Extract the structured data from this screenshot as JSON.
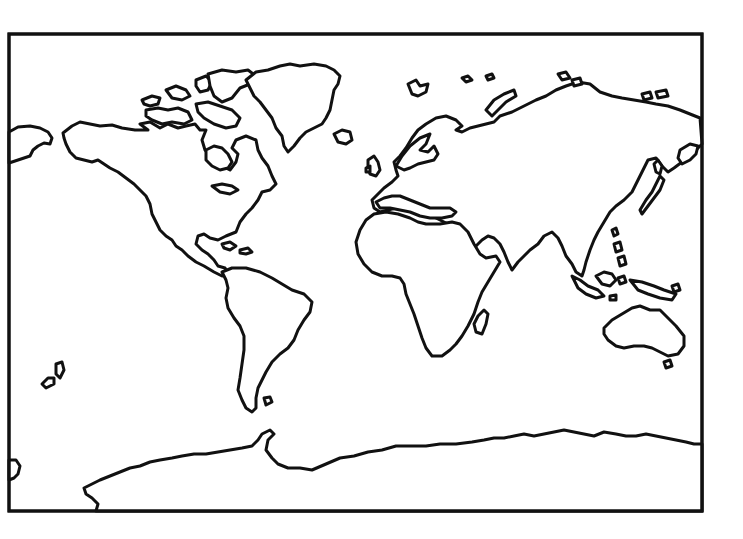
{
  "map": {
    "type": "blank-outline-world-map",
    "projection": "rectangular",
    "colors": {
      "background": "#ffffff",
      "outline": "#111111",
      "land_fill": "#ffffff"
    },
    "frame": {
      "x": 9,
      "y": 34,
      "width": 693,
      "height": 477
    },
    "regions": [
      {
        "id": "north-america",
        "name": "North America"
      },
      {
        "id": "greenland",
        "name": "Greenland"
      },
      {
        "id": "canadian-arctic-islands",
        "name": "Canadian Arctic Archipelago"
      },
      {
        "id": "iceland",
        "name": "Iceland"
      },
      {
        "id": "south-america",
        "name": "South America"
      },
      {
        "id": "caribbean",
        "name": "Caribbean Islands"
      },
      {
        "id": "eurasia",
        "name": "Europe and Asia"
      },
      {
        "id": "british-isles",
        "name": "British Isles"
      },
      {
        "id": "scandinavia",
        "name": "Scandinavia"
      },
      {
        "id": "africa",
        "name": "Africa"
      },
      {
        "id": "madagascar",
        "name": "Madagascar"
      },
      {
        "id": "japan",
        "name": "Japan"
      },
      {
        "id": "southeast-asia-islands",
        "name": "Maritime Southeast Asia"
      },
      {
        "id": "australia",
        "name": "Australia"
      },
      {
        "id": "tasmania",
        "name": "Tasmania"
      },
      {
        "id": "new-zealand",
        "name": "New Zealand"
      },
      {
        "id": "antarctica",
        "name": "Antarctica"
      },
      {
        "id": "chukotka",
        "name": "Chukotka (west edge)"
      },
      {
        "id": "arctic-islands",
        "name": "Arctic Islands"
      }
    ]
  }
}
